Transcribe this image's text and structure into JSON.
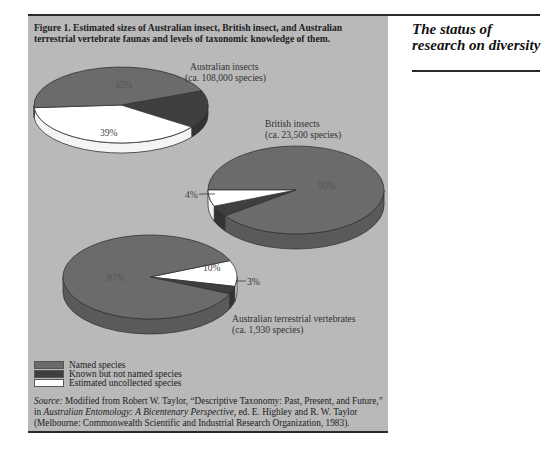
{
  "page": {
    "side_title": "The status of research on diversity"
  },
  "figure": {
    "caption": "Figure 1. Estimated sizes of Australian insect, British insect, and Australian terrestrial vertebrate faunas and levels of taxonomic knowledge of them.",
    "legend": [
      {
        "label": "Named species",
        "color": "#6b6b6b"
      },
      {
        "label": "Known but not named species",
        "color": "#3f3f3f"
      },
      {
        "label": "Estimated uncollected species",
        "color": "#ffffff"
      }
    ],
    "source_prefix": "Source:",
    "source_text_1": " Modified from Robert W. Taylor, “Descriptive Taxonomy: Past, Present, and Future,” in ",
    "source_book": "Australian Entomology: A Bicentenary Perspective,",
    "source_text_2": " ed. E. Highley and R. W. Taylor (Melbourne: Commonwealth Scientific and Industrial Research Organization, 1983)."
  },
  "chart_data": [
    {
      "type": "pie",
      "title": "Australian insects",
      "subtitle": "(ca. 108,000 species)",
      "categories": [
        "Named species",
        "Known but not named species",
        "Estimated uncollected species"
      ],
      "values": [
        45,
        16,
        39
      ],
      "labels_shown": [
        "45%",
        "",
        "39%"
      ]
    },
    {
      "type": "pie",
      "title": "British insects",
      "subtitle": "(ca. 23,500 species)",
      "categories": [
        "Named species",
        "Known but not named species",
        "Estimated uncollected species"
      ],
      "values": [
        90,
        4,
        6
      ],
      "labels_shown": [
        "90%",
        "4%",
        "6%"
      ]
    },
    {
      "type": "pie",
      "title": "Australian terrestrial vertebrates",
      "subtitle": "(ca. 1,930 species)",
      "categories": [
        "Named species",
        "Known but not named species",
        "Estimated uncollected species"
      ],
      "values": [
        87,
        3,
        10
      ],
      "labels_shown": [
        "87%",
        "3%",
        "10%"
      ]
    }
  ]
}
